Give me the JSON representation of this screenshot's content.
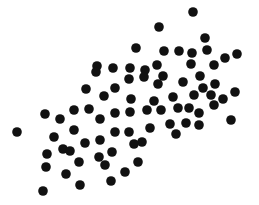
{
  "chart_data": {
    "type": "scatter",
    "title": "",
    "xlabel": "",
    "ylabel": "",
    "grid": false,
    "legend": null,
    "axes_visible": false,
    "coordinate_note": "pixel coordinates, y measured from top of image",
    "xlim": [
      0,
      259
    ],
    "ylim": [
      0,
      205
    ],
    "marker": {
      "color": "#111111",
      "radius": 4.8
    },
    "points": [
      [
        193,
        12
      ],
      [
        159,
        27
      ],
      [
        205,
        38
      ],
      [
        136,
        48
      ],
      [
        207,
        50
      ],
      [
        164,
        51
      ],
      [
        179,
        51
      ],
      [
        192,
        53
      ],
      [
        225,
        58
      ],
      [
        237,
        54
      ],
      [
        97,
        66
      ],
      [
        113,
        68
      ],
      [
        130,
        68
      ],
      [
        145,
        70
      ],
      [
        157,
        65
      ],
      [
        191,
        64
      ],
      [
        214,
        65
      ],
      [
        129,
        79
      ],
      [
        144,
        77
      ],
      [
        163,
        76
      ],
      [
        200,
        76
      ],
      [
        215,
        84
      ],
      [
        96,
        72
      ],
      [
        86,
        89
      ],
      [
        104,
        96
      ],
      [
        115,
        88
      ],
      [
        131,
        99
      ],
      [
        158,
        84
      ],
      [
        183,
        82
      ],
      [
        203,
        88
      ],
      [
        235,
        92
      ],
      [
        154,
        101
      ],
      [
        173,
        97
      ],
      [
        194,
        95
      ],
      [
        211,
        95
      ],
      [
        223,
        99
      ],
      [
        231,
        120
      ],
      [
        147,
        110
      ],
      [
        161,
        110
      ],
      [
        178,
        108
      ],
      [
        189,
        108
      ],
      [
        199,
        113
      ],
      [
        214,
        105
      ],
      [
        45,
        114
      ],
      [
        60,
        119
      ],
      [
        74,
        110
      ],
      [
        89,
        109
      ],
      [
        100,
        119
      ],
      [
        115,
        113
      ],
      [
        130,
        112
      ],
      [
        150,
        128
      ],
      [
        170,
        124
      ],
      [
        186,
        123
      ],
      [
        199,
        125
      ],
      [
        176,
        134
      ],
      [
        17,
        132
      ],
      [
        54,
        137
      ],
      [
        74,
        130
      ],
      [
        85,
        143
      ],
      [
        100,
        140
      ],
      [
        115,
        132
      ],
      [
        129,
        132
      ],
      [
        142,
        142
      ],
      [
        134,
        144
      ],
      [
        47,
        154
      ],
      [
        63,
        149
      ],
      [
        70,
        151
      ],
      [
        99,
        157
      ],
      [
        112,
        152
      ],
      [
        79,
        162
      ],
      [
        105,
        165
      ],
      [
        46,
        167
      ],
      [
        66,
        174
      ],
      [
        111,
        181
      ],
      [
        80,
        185
      ],
      [
        43,
        191
      ],
      [
        138,
        162
      ],
      [
        125,
        172
      ]
    ]
  }
}
